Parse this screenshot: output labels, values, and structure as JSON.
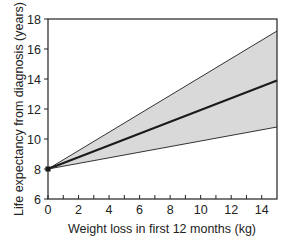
{
  "chart_data": {
    "type": "line",
    "title": "",
    "xlabel": "Weight loss in first 12 months (kg)",
    "ylabel": "Life expectancy from diagnosis (years)",
    "xlim": [
      0,
      15
    ],
    "ylim": [
      6,
      18
    ],
    "xticks": [
      0,
      2,
      4,
      6,
      8,
      10,
      12,
      14
    ],
    "xminor_ticks": [
      1,
      3,
      5,
      7,
      9,
      11,
      13
    ],
    "yticks": [
      6,
      8,
      10,
      12,
      14,
      16,
      18
    ],
    "grid": false,
    "legend": null,
    "x": [
      0,
      15
    ],
    "series": [
      {
        "name": "Upper bound",
        "values": [
          8.0,
          17.2
        ]
      },
      {
        "name": "Estimate",
        "values": [
          8.0,
          13.9
        ]
      },
      {
        "name": "Lower bound",
        "values": [
          8.0,
          10.8
        ]
      }
    ],
    "shaded_band": {
      "between": [
        "Lower bound",
        "Upper bound"
      ],
      "color": "#d9d9d9"
    },
    "marker": {
      "x": 0,
      "y": 8,
      "shape": "square"
    }
  },
  "colors": {
    "band_fill": "#d9d9d9",
    "line": "#1a1a1a",
    "bound_line": "#333333",
    "axis": "#222222"
  }
}
